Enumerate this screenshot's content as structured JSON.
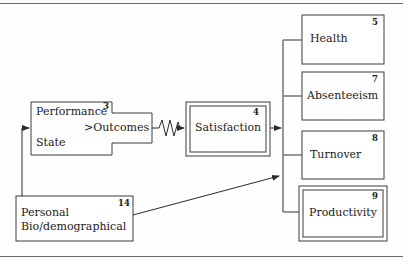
{
  "figure": {
    "frame": {
      "top_rule": true,
      "bottom_rule": true,
      "rule_color": "#6b6b6b"
    },
    "stroke_color": "#3a3a3a",
    "text_color": "#1a1a1a",
    "background": "#fefefe"
  },
  "nodes": {
    "performance": {
      "id": "3",
      "line1": "Performance",
      "line2": "State",
      "tab_label": ">Outcomes",
      "shape": "stepped-polygon",
      "double_border": false
    },
    "satisfaction": {
      "id": "4",
      "label": "Satisfaction",
      "shape": "rectangle",
      "double_border": true
    },
    "health": {
      "id": "5",
      "label": "Health",
      "shape": "rectangle",
      "double_border": false
    },
    "absenteeism": {
      "id": "7",
      "label": "Absenteeism",
      "shape": "rectangle",
      "double_border": false
    },
    "turnover": {
      "id": "8",
      "label": "Turnover",
      "shape": "rectangle",
      "double_border": false
    },
    "productivity": {
      "id": "9",
      "label": "Productivity",
      "shape": "rectangle",
      "double_border": true
    },
    "personal": {
      "id": "14",
      "line1": "Personal",
      "line2": "Bio/demographical",
      "shape": "rectangle",
      "double_border": false
    }
  },
  "connectors": [
    {
      "name": "performance-to-satisfaction",
      "from": "performance",
      "to": "satisfaction",
      "style": "zigzag",
      "arrowhead": "right"
    },
    {
      "name": "satisfaction-to-outcomes-trunk",
      "from": "satisfaction",
      "to": "outcomes-trunk",
      "style": "straight",
      "arrowhead": "right"
    },
    {
      "name": "personal-to-outcomes-trunk",
      "from": "personal",
      "to": "outcomes-trunk",
      "style": "diagonal",
      "arrowhead": "right"
    },
    {
      "name": "personal-to-performance-feedback",
      "from": "personal",
      "to": "performance",
      "style": "elbow",
      "arrowhead": "right"
    },
    {
      "name": "trunk-branch-health",
      "from": "outcomes-trunk",
      "to": "health",
      "style": "branch",
      "arrowhead": "none"
    },
    {
      "name": "trunk-branch-absenteeism",
      "from": "outcomes-trunk",
      "to": "absenteeism",
      "style": "branch",
      "arrowhead": "none"
    },
    {
      "name": "trunk-branch-turnover",
      "from": "outcomes-trunk",
      "to": "turnover",
      "style": "branch",
      "arrowhead": "none"
    },
    {
      "name": "trunk-branch-productivity",
      "from": "outcomes-trunk",
      "to": "productivity",
      "style": "branch",
      "arrowhead": "none"
    }
  ]
}
